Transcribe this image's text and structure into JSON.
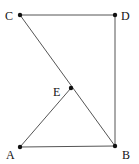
{
  "diagram": {
    "points": {
      "C": {
        "label": "C",
        "x": 20,
        "y": 15
      },
      "D": {
        "label": "D",
        "x": 115,
        "y": 15
      },
      "E": {
        "label": "E",
        "x": 71,
        "y": 88
      },
      "A": {
        "label": "A",
        "x": 20,
        "y": 147
      },
      "B": {
        "label": "B",
        "x": 115,
        "y": 146
      }
    },
    "segments": [
      [
        "C",
        "D"
      ],
      [
        "D",
        "B"
      ],
      [
        "C",
        "B"
      ],
      [
        "A",
        "E"
      ],
      [
        "A",
        "B"
      ]
    ],
    "colors": {
      "line": "#555555",
      "point": "#111111",
      "text": "#111111"
    }
  }
}
